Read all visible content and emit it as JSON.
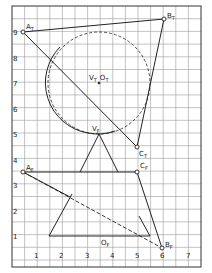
{
  "diagram": {
    "title": "",
    "type": "descriptive-geometry-projection",
    "grid": {
      "x_ticks": [
        "1",
        "2",
        "3",
        "4",
        "5",
        "6",
        "7"
      ],
      "y_ticks": [
        "1",
        "2",
        "3",
        "4",
        "5",
        "6",
        "7",
        "8",
        "9"
      ],
      "minor_step": 0.5
    },
    "points": {
      "A_T": {
        "label": "A",
        "sub": "T",
        "x": 0.5,
        "y": 9
      },
      "B_T": {
        "label": "B",
        "sub": "T",
        "x": 6,
        "y": 9.5
      },
      "C_T": {
        "label": "C",
        "sub": "T",
        "x": 5,
        "y": 4.5
      },
      "A_F": {
        "label": "A",
        "sub": "F",
        "x": 0.5,
        "y": 3.5
      },
      "C_F": {
        "label": "C",
        "sub": "F",
        "x": 5,
        "y": 3.5
      },
      "B_F": {
        "label": "B",
        "sub": "F",
        "x": 6,
        "y": 0.5
      },
      "V_T": {
        "label": "V",
        "sub": "T",
        "x": 3.5,
        "y": 7
      },
      "O_T": {
        "label": "O",
        "sub": "T",
        "x": 3.5,
        "y": 7
      },
      "V_F": {
        "label": "V",
        "sub": "F",
        "x": 3.5,
        "y": 5
      },
      "O_F": {
        "label": "O",
        "sub": "F",
        "x": 3.5,
        "y": 1
      }
    },
    "labels": {
      "a_t": "A",
      "a_t_sub": "T",
      "b_t": "B",
      "b_t_sub": "T",
      "c_t": "C",
      "c_t_sub": "T",
      "a_f": "A",
      "a_f_sub": "F",
      "c_f": "C",
      "c_f_sub": "F",
      "b_f": "B",
      "b_f_sub": "F",
      "vt_ot": "V",
      "vt_sub": "T",
      "ot": "O",
      "ot_sub": "T",
      "v_f": "V",
      "v_f_sub": "F",
      "o_f": "O",
      "o_f_sub": "F"
    },
    "colors": {
      "ink": "#222222",
      "grid": "#9a9a9a",
      "background": "#ffffff"
    }
  }
}
